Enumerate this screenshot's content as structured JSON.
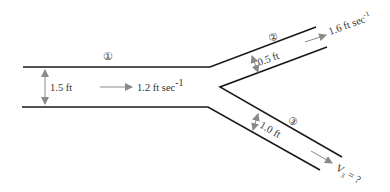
{
  "diagram": {
    "type": "pipe-branch-flow",
    "colors": {
      "pipe": "#1a1a1a",
      "arrow": "#8a8a8a",
      "text": "#333333",
      "background": "#ffffff"
    },
    "sections": [
      {
        "id": "1",
        "marker": "①",
        "width_label": "1.5 ft",
        "velocity_label": "1.2 ft sec",
        "velocity_exp": "-1"
      },
      {
        "id": "2",
        "marker": "②",
        "width_label": "0.5 ft",
        "velocity_label": "1.6 ft sec",
        "velocity_exp": "-1"
      },
      {
        "id": "3",
        "marker": "③",
        "width_label": "1.0 ft",
        "velocity_label": "V",
        "velocity_sub": "3",
        "velocity_suffix": " = ?"
      }
    ]
  }
}
